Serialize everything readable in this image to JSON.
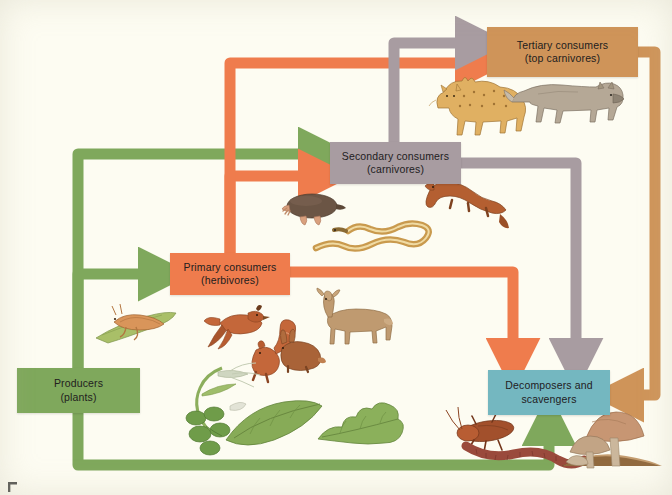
{
  "figure": {
    "background_color": "#fdfcf2"
  },
  "nodes": [
    {
      "id": "tertiary",
      "line1": "Tertiary consumers",
      "line2": "(top carnivores)",
      "color": "#cf9459"
    },
    {
      "id": "secondary",
      "line1": "Secondary consumers",
      "line2": "(carnivores)",
      "color": "#a89ca1"
    },
    {
      "id": "primary",
      "line1": "Primary consumers",
      "line2": "(herbivores)",
      "color": "#ef7c4d"
    },
    {
      "id": "producers",
      "line1": "Producers",
      "line2": "(plants)",
      "color": "#7fa85c"
    },
    {
      "id": "decomposers",
      "line1": "Decomposers and",
      "line2": "scavengers",
      "color": "#74b7c0"
    }
  ],
  "arrow_colors": {
    "producer_flow": "#7fa85c",
    "primary_flow": "#ef7c4d",
    "secondary_flow": "#a89ca1",
    "tertiary_flow": "#cf9459"
  },
  "flows": [
    {
      "from": "producers",
      "to": "primary",
      "color": "#7fa85c"
    },
    {
      "from": "producers",
      "to": "secondary",
      "color": "#7fa85c"
    },
    {
      "from": "producers",
      "to": "decomposers",
      "color": "#7fa85c"
    },
    {
      "from": "primary",
      "to": "secondary",
      "color": "#ef7c4d"
    },
    {
      "from": "primary",
      "to": "tertiary",
      "color": "#ef7c4d"
    },
    {
      "from": "primary",
      "to": "decomposers",
      "color": "#ef7c4d"
    },
    {
      "from": "secondary",
      "to": "tertiary",
      "color": "#a89ca1"
    },
    {
      "from": "secondary",
      "to": "decomposers",
      "color": "#a89ca1"
    },
    {
      "from": "tertiary",
      "to": "decomposers",
      "color": "#cf9459"
    }
  ],
  "organisms": {
    "tertiary": [
      "bobcat",
      "wolf"
    ],
    "secondary": [
      "mole",
      "garter-snake",
      "weasel"
    ],
    "primary": [
      "grasshopper",
      "quail",
      "squirrel",
      "rabbit",
      "deer"
    ],
    "producers": [
      "grass-seedhead",
      "clover",
      "broad-leaf",
      "oak-leaf"
    ],
    "decomposers": [
      "cockroach",
      "earthworm",
      "mushrooms"
    ]
  }
}
